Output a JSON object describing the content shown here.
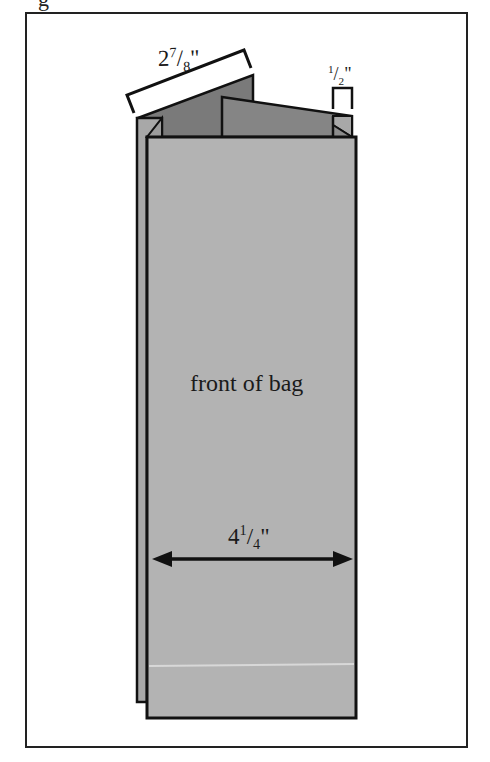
{
  "figure": {
    "partial_caption": "g",
    "front_label": "front of bag",
    "width_dimension": {
      "whole": "4",
      "num": "1",
      "den": "4",
      "unit": "\""
    },
    "top_dimension": {
      "whole": "2",
      "num": "7",
      "den": "8",
      "unit": "\""
    },
    "gusset_dimension": {
      "whole": "",
      "num": "1",
      "den": "2",
      "unit": "\""
    },
    "colors": {
      "front_panel": "#b3b3b3",
      "back_fold": "#7a7a7a",
      "side_panel": "#a8a8a8",
      "outline": "#111111"
    }
  }
}
